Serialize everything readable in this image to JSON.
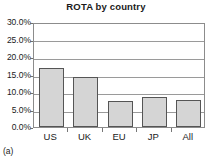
{
  "chart_data": {
    "type": "bar",
    "title": "ROTA by country",
    "xlabel": "",
    "ylabel": "",
    "categories": [
      "US",
      "UK",
      "EU",
      "JP",
      "All"
    ],
    "values": [
      17.0,
      14.3,
      7.4,
      8.5,
      7.8
    ],
    "value_labels": [
      "17.0%",
      "14.3%",
      "7.4%",
      "8.5%",
      "7.8%"
    ],
    "ylim": [
      0.0,
      30.0
    ],
    "ytick_values": [
      0.0,
      5.0,
      10.0,
      15.0,
      20.0,
      25.0,
      30.0
    ],
    "ytick_labels": [
      "0.0%",
      "5.0%",
      "10.0%",
      "15.0%",
      "20.0%",
      "25.0%",
      "30.0%"
    ],
    "grid": true,
    "grid_axis": "y",
    "legend": false,
    "legend_position": "none",
    "bar_fill_color": "#d5d5d5",
    "bar_border_color": "#555555",
    "gridline_color": "#9a9a9a",
    "plot_border_color": "#8c8c8c",
    "text_color": "#1a1a1a"
  },
  "caption": {
    "label": "(a)"
  }
}
